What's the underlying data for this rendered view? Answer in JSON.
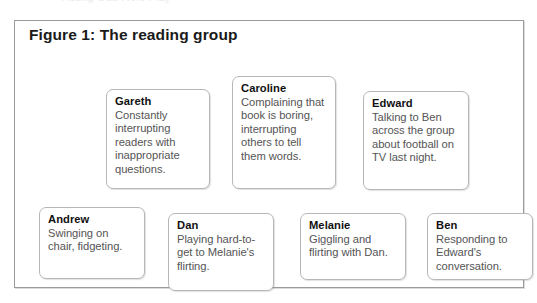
{
  "page": {
    "clipped_top_text": "Acting Out: Role Play"
  },
  "figure": {
    "title": "Figure 1: The reading group",
    "rows": [
      {
        "row_name": "top-row",
        "cards": [
          {
            "id": "gareth",
            "name": "Gareth",
            "description": "Constantly interrupting readers with inappropriate questions."
          },
          {
            "id": "caroline",
            "name": "Caroline",
            "description": "Complaining that book is boring, interrupting others to tell them words."
          },
          {
            "id": "edward",
            "name": "Edward",
            "description": "Talking to Ben across the group about football on TV last night."
          }
        ]
      },
      {
        "row_name": "bottom-row",
        "cards": [
          {
            "id": "andrew",
            "name": "Andrew",
            "description": "Swinging on chair, fidgeting."
          },
          {
            "id": "dan",
            "name": "Dan",
            "description": "Playing hard-to-get to Melanie's flirting."
          },
          {
            "id": "melanie",
            "name": "Melanie",
            "description": "Giggling and flirting with Dan."
          },
          {
            "id": "ben",
            "name": "Ben",
            "description": "Responding to Edward's conversation."
          }
        ]
      }
    ]
  },
  "colors": {
    "frame_border": "#9b9b9b",
    "card_border": "#b7b7b7",
    "title_text": "#1a1a1a",
    "name_text": "#111111",
    "body_text": "#555555",
    "background": "#ffffff"
  }
}
